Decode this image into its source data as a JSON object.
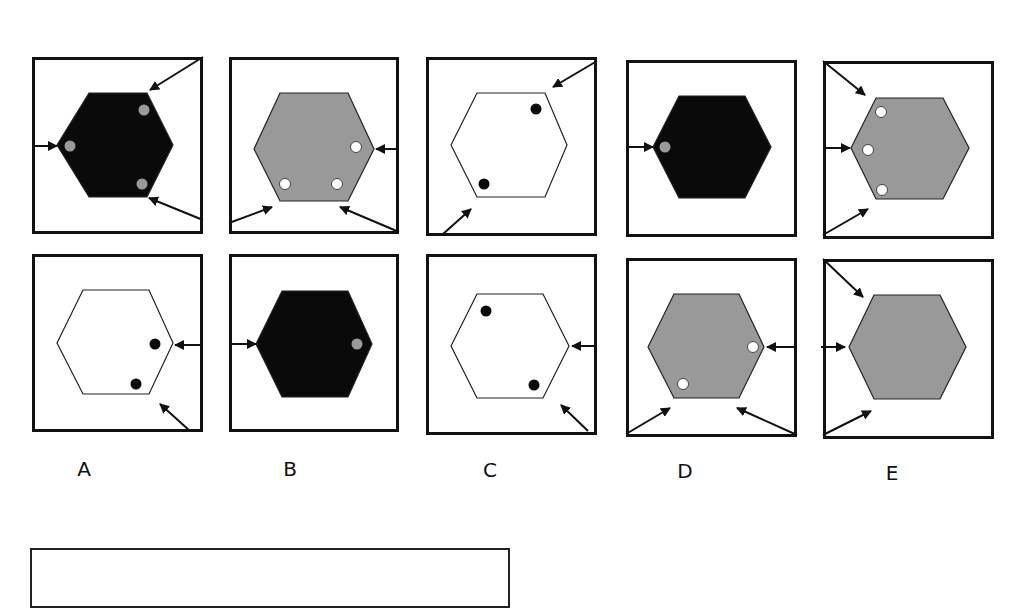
{
  "colors": {
    "black": "#0a0a0a",
    "gray": "#999999",
    "white": "#ffffff",
    "dot_gray": "#9a9a9a",
    "stroke": "#222222"
  },
  "labels": [
    {
      "text": "A",
      "x": 84,
      "y": 457
    },
    {
      "text": "B",
      "x": 290,
      "y": 457
    },
    {
      "text": "C",
      "x": 490,
      "y": 458
    },
    {
      "text": "D",
      "x": 685,
      "y": 459
    },
    {
      "text": "E",
      "x": 892,
      "y": 461
    }
  ],
  "panels": [
    {
      "id": "top-a",
      "column": "A",
      "row": "top",
      "x": 32,
      "y": 57,
      "w": 171,
      "h": 177,
      "hexagon": {
        "fill": "black",
        "points": [
          [
            25,
            88
          ],
          [
            57,
            36
          ],
          [
            115,
            36
          ],
          [
            141,
            88
          ],
          [
            115,
            140
          ],
          [
            57,
            140
          ]
        ]
      },
      "dots": [
        {
          "cx": 112,
          "cy": 53,
          "fill": "dot_gray"
        },
        {
          "cx": 38,
          "cy": 89,
          "fill": "dot_gray"
        },
        {
          "cx": 110,
          "cy": 127,
          "fill": "dot_gray"
        }
      ],
      "arrows": [
        [
          171,
          0,
          118,
          33
        ],
        [
          0,
          89,
          25,
          89
        ],
        [
          171,
          163,
          117,
          141
        ]
      ]
    },
    {
      "id": "top-b",
      "column": "B",
      "row": "top",
      "x": 229,
      "y": 57,
      "w": 170,
      "h": 177,
      "hexagon": {
        "fill": "gray",
        "points": [
          [
            25,
            92
          ],
          [
            51,
            36
          ],
          [
            119,
            36
          ],
          [
            145,
            92
          ],
          [
            119,
            144
          ],
          [
            51,
            144
          ]
        ]
      },
      "dots": [
        {
          "cx": 127,
          "cy": 90,
          "fill": "white"
        },
        {
          "cx": 56,
          "cy": 127,
          "fill": "white"
        },
        {
          "cx": 108,
          "cy": 127,
          "fill": "white"
        }
      ],
      "arrows": [
        [
          170,
          92,
          147,
          92
        ],
        [
          0,
          166,
          43,
          150
        ],
        [
          170,
          175,
          111,
          150
        ]
      ]
    },
    {
      "id": "top-c",
      "column": "C",
      "row": "top",
      "x": 426,
      "y": 57,
      "w": 171,
      "h": 179,
      "hexagon": {
        "fill": "white",
        "points": [
          [
            25,
            88
          ],
          [
            51,
            36
          ],
          [
            119,
            36
          ],
          [
            141,
            88
          ],
          [
            119,
            140
          ],
          [
            51,
            140
          ]
        ]
      },
      "dots": [
        {
          "cx": 110,
          "cy": 52,
          "fill": "black"
        },
        {
          "cx": 58,
          "cy": 127,
          "fill": "black"
        }
      ],
      "arrows": [
        [
          171,
          4,
          127,
          30
        ],
        [
          17,
          177,
          45,
          152
        ]
      ]
    },
    {
      "id": "top-d",
      "column": "D",
      "row": "top",
      "x": 626,
      "y": 60,
      "w": 171,
      "h": 177,
      "hexagon": {
        "fill": "black",
        "points": [
          [
            27,
            87
          ],
          [
            53,
            36
          ],
          [
            119,
            36
          ],
          [
            145,
            87
          ],
          [
            119,
            138
          ],
          [
            53,
            138
          ]
        ]
      },
      "dots": [
        {
          "cx": 39,
          "cy": 87,
          "fill": "dot_gray"
        }
      ],
      "arrows": [
        [
          0,
          87,
          27,
          87
        ]
      ]
    },
    {
      "id": "top-e",
      "column": "E",
      "row": "top",
      "x": 823,
      "y": 61,
      "w": 171,
      "h": 178,
      "hexagon": {
        "fill": "gray",
        "points": [
          [
            28,
            87
          ],
          [
            53,
            37
          ],
          [
            120,
            37
          ],
          [
            146,
            87
          ],
          [
            120,
            138
          ],
          [
            53,
            138
          ]
        ]
      },
      "dots": [
        {
          "cx": 58,
          "cy": 51,
          "fill": "white"
        },
        {
          "cx": 45,
          "cy": 89,
          "fill": "white"
        },
        {
          "cx": 59,
          "cy": 129,
          "fill": "white"
        }
      ],
      "arrows": [
        [
          0,
          0,
          42,
          34
        ],
        [
          0,
          87,
          27,
          87
        ],
        [
          0,
          174,
          45,
          148
        ]
      ]
    },
    {
      "id": "bottom-a",
      "column": "A",
      "row": "bottom",
      "x": 32,
      "y": 254,
      "w": 171,
      "h": 178,
      "hexagon": {
        "fill": "white",
        "points": [
          [
            25,
            89
          ],
          [
            51,
            36
          ],
          [
            117,
            36
          ],
          [
            141,
            89
          ],
          [
            117,
            140
          ],
          [
            51,
            140
          ]
        ]
      },
      "dots": [
        {
          "cx": 123,
          "cy": 90,
          "fill": "black"
        },
        {
          "cx": 104,
          "cy": 130,
          "fill": "black"
        }
      ],
      "arrows": [
        [
          170,
          91,
          143,
          91
        ],
        [
          158,
          177,
          128,
          150
        ]
      ]
    },
    {
      "id": "bottom-b",
      "column": "B",
      "row": "bottom",
      "x": 229,
      "y": 254,
      "w": 170,
      "h": 178,
      "hexagon": {
        "fill": "black",
        "points": [
          [
            27,
            90
          ],
          [
            53,
            37
          ],
          [
            119,
            37
          ],
          [
            143,
            90
          ],
          [
            119,
            143
          ],
          [
            53,
            143
          ]
        ]
      },
      "dots": [
        {
          "cx": 128,
          "cy": 90,
          "fill": "dot_gray"
        }
      ],
      "arrows": [
        [
          0,
          90,
          27,
          90
        ]
      ]
    },
    {
      "id": "bottom-c",
      "column": "C",
      "row": "bottom",
      "x": 426,
      "y": 254,
      "w": 171,
      "h": 181,
      "hexagon": {
        "fill": "white",
        "points": [
          [
            25,
            92
          ],
          [
            51,
            40
          ],
          [
            117,
            40
          ],
          [
            143,
            92
          ],
          [
            117,
            144
          ],
          [
            51,
            144
          ]
        ]
      },
      "dots": [
        {
          "cx": 60,
          "cy": 57,
          "fill": "black"
        },
        {
          "cx": 108,
          "cy": 131,
          "fill": "black"
        }
      ],
      "arrows": [
        [
          171,
          92,
          146,
          92
        ],
        [
          162,
          177,
          135,
          151
        ]
      ]
    },
    {
      "id": "bottom-d",
      "column": "D",
      "row": "bottom",
      "x": 626,
      "y": 258,
      "w": 171,
      "h": 179,
      "hexagon": {
        "fill": "gray",
        "points": [
          [
            22,
            89
          ],
          [
            48,
            36
          ],
          [
            113,
            36
          ],
          [
            138,
            89
          ],
          [
            113,
            140
          ],
          [
            48,
            140
          ]
        ]
      },
      "dots": [
        {
          "cx": 127,
          "cy": 89,
          "fill": "white"
        },
        {
          "cx": 57,
          "cy": 126,
          "fill": "white"
        }
      ],
      "arrows": [
        [
          171,
          89,
          141,
          89
        ],
        [
          0,
          176,
          44,
          150
        ],
        [
          171,
          177,
          111,
          150
        ]
      ]
    },
    {
      "id": "bottom-e",
      "column": "E",
      "row": "bottom",
      "x": 823,
      "y": 259,
      "w": 171,
      "h": 180,
      "hexagon": {
        "fill": "gray",
        "points": [
          [
            26,
            88
          ],
          [
            51,
            36
          ],
          [
            117,
            36
          ],
          [
            143,
            88
          ],
          [
            117,
            140
          ],
          [
            51,
            140
          ]
        ]
      },
      "dots": [],
      "arrows": [
        [
          0,
          0,
          40,
          38
        ],
        [
          -2,
          88,
          22,
          88
        ],
        [
          0,
          176,
          48,
          152
        ]
      ]
    }
  ],
  "answer_box": {
    "x": 30,
    "y": 548,
    "w": 480,
    "h": 60
  }
}
